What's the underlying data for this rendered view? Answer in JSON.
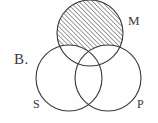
{
  "figure": {
    "type": "venn-diagram",
    "item_label": "B.",
    "background_color": "#fefefe",
    "stroke_color": "#3a3a3a",
    "hatch_color": "#4a4a4a",
    "stroke_width": 1.1,
    "hatch_angle_degrees": 45,
    "hatch_spacing_px": 3.2
  },
  "circles": [
    {
      "id": "m",
      "label": "M",
      "cx": 90,
      "cy": 33,
      "r": 33,
      "shaded": true,
      "shading": "hatched",
      "shade_description": "M outside S and P is hatched"
    },
    {
      "id": "s",
      "label": "S",
      "cx": 69,
      "cy": 78,
      "r": 33,
      "shaded": false,
      "shading": "none",
      "shade_description": ""
    },
    {
      "id": "p",
      "label": "P",
      "cx": 108,
      "cy": 78,
      "r": 33,
      "shaded": false,
      "shading": "none",
      "shade_description": ""
    }
  ],
  "labels": {
    "item": "B.",
    "middle": "M",
    "subject": "S",
    "predicate": "P"
  }
}
